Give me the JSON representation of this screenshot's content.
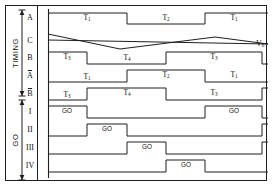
{
  "figure": {
    "kind": "timing-diagram",
    "group_labels": [
      {
        "name": "timing-group-label",
        "text": "TIMING",
        "y_top": 10,
        "y_bottom": 96
      },
      {
        "name": "go-group-label",
        "text": "GO",
        "y_top": 100,
        "y_bottom": 180
      }
    ],
    "signal_label": {
      "text": "V",
      "sub": "6",
      "x": 256,
      "y": 44
    }
  },
  "chart_data": {
    "type": "line",
    "title": "",
    "xlabel": "",
    "ylabel": "",
    "grid": false,
    "legend": "none",
    "x_axis": {
      "origin": 48,
      "end": 268,
      "min": 48,
      "max": 268
    },
    "transitions": [
      48,
      87,
      127,
      166,
      205,
      245,
      262
    ],
    "rows": [
      {
        "label": "A",
        "overbar": false,
        "kind": "digital",
        "y_hi": 13,
        "y_lo": 24,
        "start_level": "high",
        "edges": [
          127,
          205
        ],
        "end_level": "high",
        "segments": [
          {
            "text": "T",
            "sub": "1",
            "x": 87,
            "y": 18
          },
          {
            "text": "T",
            "sub": "2",
            "x": 166,
            "y": 18
          },
          {
            "text": "T",
            "sub": "1",
            "x": 234,
            "y": 18
          }
        ]
      },
      {
        "label": "C",
        "overbar": false,
        "kind": "analog",
        "y_hi": 33,
        "y_lo": 50,
        "triangle": [
          [
            48,
            34
          ],
          [
            120,
            49
          ],
          [
            215,
            37
          ],
          [
            268,
            44
          ]
        ],
        "ramp": [
          [
            48,
            40
          ],
          [
            268,
            44
          ]
        ],
        "segments": []
      },
      {
        "label": "B",
        "overbar": false,
        "kind": "digital",
        "y_hi": 52,
        "y_lo": 64,
        "start_level": "high",
        "edges": [
          87,
          166,
          262
        ],
        "end_level": "low",
        "segments": [
          {
            "text": "T",
            "sub": "3",
            "x": 67,
            "y": 57
          },
          {
            "text": "T",
            "sub": "4",
            "x": 127,
            "y": 58
          },
          {
            "text": "T",
            "sub": "3",
            "x": 214,
            "y": 57
          }
        ]
      },
      {
        "label": "A",
        "overbar": true,
        "kind": "digital",
        "y_hi": 70,
        "y_lo": 82,
        "start_level": "low",
        "edges": [
          127,
          205
        ],
        "end_level": "low",
        "segments": [
          {
            "text": "T",
            "sub": "1",
            "x": 87,
            "y": 77
          },
          {
            "text": "T",
            "sub": "2",
            "x": 166,
            "y": 75
          },
          {
            "text": "T",
            "sub": "1",
            "x": 234,
            "y": 75
          }
        ]
      },
      {
        "label": "B",
        "overbar": true,
        "kind": "digital",
        "y_hi": 88,
        "y_lo": 100,
        "start_level": "low",
        "edges": [
          87,
          166,
          262
        ],
        "end_level": "high",
        "segments": [
          {
            "text": "T",
            "sub": "3",
            "x": 67,
            "y": 95
          },
          {
            "text": "T",
            "sub": "4",
            "x": 127,
            "y": 93
          },
          {
            "text": "T",
            "sub": "3",
            "x": 214,
            "y": 93
          }
        ]
      },
      {
        "label": "I",
        "overbar": false,
        "kind": "digital",
        "y_hi": 106,
        "y_lo": 118,
        "start_level": "high",
        "edges": [
          87,
          205,
          262
        ],
        "end_level": "low",
        "segments": [
          {
            "text": "GO",
            "x": 67,
            "y": 111
          },
          {
            "text": "GO",
            "x": 234,
            "y": 111
          }
        ]
      },
      {
        "label": "II",
        "overbar": false,
        "kind": "digital",
        "y_hi": 124,
        "y_lo": 136,
        "start_level": "low",
        "edges": [
          87,
          127,
          262
        ],
        "end_level": "high",
        "segments": [
          {
            "text": "GO",
            "x": 107,
            "y": 129
          }
        ]
      },
      {
        "label": "III",
        "overbar": false,
        "kind": "digital",
        "y_hi": 142,
        "y_lo": 154,
        "start_level": "low",
        "edges": [
          127,
          166,
          262
        ],
        "end_level": "high",
        "segments": [
          {
            "text": "GO",
            "x": 147,
            "y": 147
          }
        ]
      },
      {
        "label": "IV",
        "overbar": false,
        "kind": "digital",
        "y_hi": 160,
        "y_lo": 172,
        "start_level": "low",
        "edges": [
          166,
          205
        ],
        "end_level": "low",
        "segments": [
          {
            "text": "GO",
            "x": 186,
            "y": 165
          }
        ]
      }
    ]
  }
}
